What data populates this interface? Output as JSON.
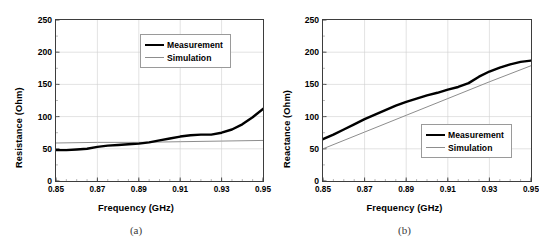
{
  "running_head": {
    "folio": "6",
    "text": "CHAPTER 1.  DESIGN AND ANALYSIS OF PLANAR ANTENNAS"
  },
  "figure": {
    "panels": [
      {
        "id": "a",
        "caption": "(a)",
        "legend_position": "top-right",
        "chart": {
          "type": "line",
          "title": "",
          "xlabel": "Frequency (GHz)",
          "ylabel": "Resistance (Ohm)",
          "xlim": [
            0.85,
            0.95
          ],
          "ylim": [
            0,
            250
          ],
          "xticks": [
            "0.85",
            "0.87",
            "0.89",
            "0.91",
            "0.93",
            "0.95"
          ],
          "xtick_values": [
            0.85,
            0.87,
            0.89,
            0.91,
            0.93,
            0.95
          ],
          "yticks": [
            "0",
            "50",
            "100",
            "150",
            "200",
            "250"
          ],
          "ytick_values": [
            0,
            50,
            100,
            150,
            200,
            250
          ],
          "grid": true,
          "series": [
            {
              "name": "Measurement",
              "color": "#000000",
              "width": 2.4,
              "x": [
                0.85,
                0.855,
                0.86,
                0.865,
                0.87,
                0.875,
                0.88,
                0.885,
                0.89,
                0.895,
                0.9,
                0.905,
                0.91,
                0.915,
                0.92,
                0.925,
                0.93,
                0.935,
                0.94,
                0.945,
                0.95
              ],
              "y": [
                48,
                48,
                49,
                50,
                53,
                55,
                56,
                57,
                58,
                60,
                63,
                66,
                69,
                71,
                72,
                72,
                75,
                80,
                88,
                99,
                112
              ]
            },
            {
              "name": "Simulation",
              "color": "#8d8d8d",
              "width": 1.0,
              "x": [
                0.85,
                0.87,
                0.89,
                0.91,
                0.93,
                0.95
              ],
              "y": [
                59,
                60,
                60,
                61,
                62,
                63
              ]
            }
          ]
        }
      },
      {
        "id": "b",
        "caption": "(b)",
        "legend_position": "bottom-right",
        "chart": {
          "type": "line",
          "title": "",
          "xlabel": "Frequency (GHz)",
          "ylabel": "Reactance (Ohm)",
          "xlim": [
            0.85,
            0.95
          ],
          "ylim": [
            0,
            250
          ],
          "xticks": [
            "0.85",
            "0.87",
            "0.89",
            "0.91",
            "0.93",
            "0.95"
          ],
          "xtick_values": [
            0.85,
            0.87,
            0.89,
            0.91,
            0.93,
            0.95
          ],
          "yticks": [
            "0",
            "50",
            "100",
            "150",
            "200",
            "250"
          ],
          "ytick_values": [
            0,
            50,
            100,
            150,
            200,
            250
          ],
          "grid": true,
          "series": [
            {
              "name": "Measurement",
              "color": "#000000",
              "width": 2.4,
              "x": [
                0.85,
                0.855,
                0.86,
                0.865,
                0.87,
                0.875,
                0.88,
                0.885,
                0.89,
                0.895,
                0.9,
                0.905,
                0.91,
                0.915,
                0.92,
                0.925,
                0.93,
                0.935,
                0.94,
                0.945,
                0.95
              ],
              "y": [
                65,
                72,
                80,
                88,
                96,
                103,
                110,
                117,
                123,
                128,
                133,
                137,
                142,
                146,
                152,
                162,
                170,
                176,
                181,
                185,
                187
              ]
            },
            {
              "name": "Simulation",
              "color": "#8d8d8d",
              "width": 1.0,
              "x": [
                0.85,
                0.87,
                0.89,
                0.91,
                0.93,
                0.95
              ],
              "y": [
                50,
                76,
                102,
                128,
                154,
                179
              ]
            }
          ]
        }
      }
    ],
    "legend_labels": {
      "measurement": "Measurement",
      "simulation": "Simulation"
    }
  },
  "colors": {
    "measurement": "#000000",
    "simulation": "#8d8d8d",
    "frame": "#3d3d3d",
    "grid": "#cfcfcf"
  }
}
